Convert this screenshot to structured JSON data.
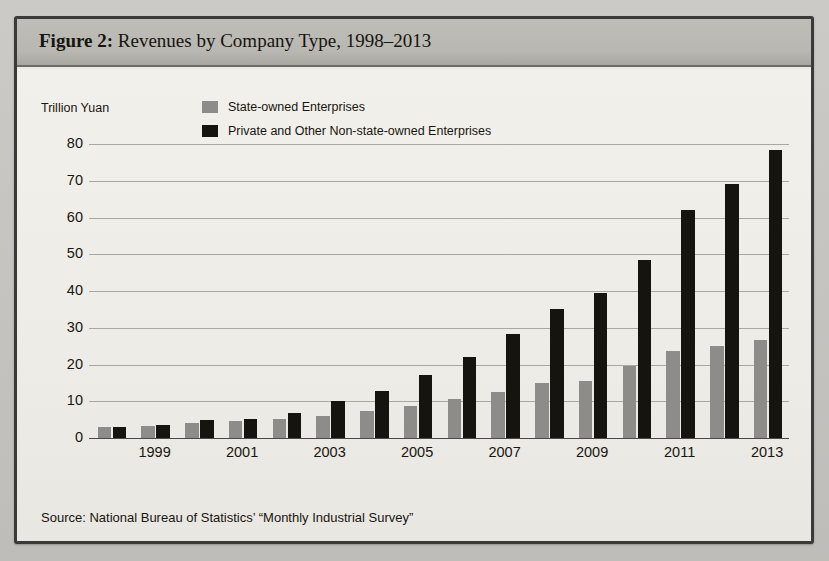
{
  "figure": {
    "label": "Figure 2:",
    "title": " Revenues by Company Type, 1998–2013",
    "full_title": "Figure 2: Revenues by Company Type, 1998–2013",
    "source": "Source: National Bureau of Statistics’ “Monthly Industrial Survey”"
  },
  "legend": {
    "position": "top-center",
    "items": [
      {
        "label": "State-owned Enterprises",
        "color": "#8e8c88"
      },
      {
        "label": "Private and Other Non-state-owned Enterprises",
        "color": "#15140f"
      }
    ]
  },
  "page_ghost_text": [
    {
      "text": "concerns and their need to account for",
      "x": 300,
      "y": 112
    },
    {
      "text": "the people who manage them still",
      "x": 250,
      "y": 150
    },
    {
      "text": "as the majority of state-owned",
      "x": 175,
      "y": 190
    },
    {
      "text": "remain subject to direct state oversight",
      "x": 130,
      "y": 228
    },
    {
      "text": "the share of national output and",
      "x": 140,
      "y": 268
    },
    {
      "text": "performance of state enterprises as",
      "x": 150,
      "y": 306
    },
    {
      "text": "the corporate form itself",
      "x": 185,
      "y": 344
    },
    {
      "text": "and the extent of market",
      "x": 210,
      "y": 382
    },
    {
      "text": "accordingly",
      "x": 240,
      "y": 420
    },
    {
      "text": "the title is",
      "x": 520,
      "y": 520
    }
  ],
  "chart_data": {
    "type": "bar",
    "title": "Revenues by Company Type, 1998–2013",
    "xlabel": "",
    "ylabel": "Trillion Yuan",
    "ylim": [
      0,
      85
    ],
    "yticks": [
      0,
      10,
      20,
      30,
      40,
      50,
      60,
      70,
      80
    ],
    "ytick_labels": [
      "0",
      "10",
      "20",
      "30",
      "40",
      "50",
      "60",
      "70",
      "80"
    ],
    "grid": true,
    "categories": [
      1998,
      1999,
      2000,
      2001,
      2002,
      2003,
      2004,
      2005,
      2006,
      2007,
      2008,
      2009,
      2010,
      2011,
      2012,
      2013
    ],
    "xtick_labels": [
      "1999",
      "2001",
      "2003",
      "2005",
      "2007",
      "2009",
      "2011",
      "2013"
    ],
    "xtick_categories": [
      1999,
      2001,
      2003,
      2005,
      2007,
      2009,
      2011,
      2013
    ],
    "series": [
      {
        "name": "State-owned Enterprises",
        "color": "#8e8c88",
        "values": [
          3.0,
          3.2,
          4.2,
          4.6,
          5.1,
          5.9,
          7.3,
          8.7,
          10.5,
          12.6,
          15.0,
          15.5,
          19.7,
          23.6,
          25.2,
          26.7
        ]
      },
      {
        "name": "Private and Other Non-state-owned Enterprises",
        "color": "#15140f",
        "values": [
          3.1,
          3.6,
          4.8,
          5.3,
          6.7,
          10.0,
          12.9,
          17.2,
          22.1,
          28.4,
          35.1,
          39.5,
          48.5,
          62.0,
          69.3,
          78.5
        ]
      }
    ]
  }
}
